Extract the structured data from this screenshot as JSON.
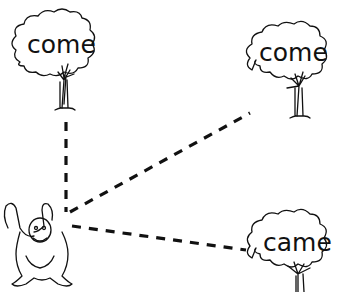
{
  "worksheet": {
    "trees": [
      {
        "id": "tree-top-left",
        "word": "come"
      },
      {
        "id": "tree-top-right",
        "word": "come"
      },
      {
        "id": "tree-bottom-right",
        "word": "came"
      }
    ],
    "character": "monkey",
    "connector_style": "dashed",
    "colors": {
      "line": "#111111",
      "background": "#ffffff"
    }
  }
}
